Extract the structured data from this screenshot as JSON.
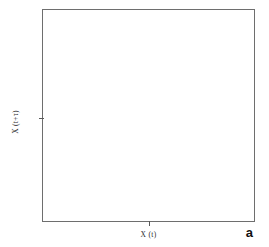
{
  "figure": {
    "panel_label": "a",
    "background_color": "#ffffff",
    "frame_color": "#6e6e6e",
    "axes": {
      "xlabel": "X (t)",
      "ylabel": "X (t+τ)",
      "x_ticks": [
        {
          "label": "",
          "pos": 0.5
        }
      ],
      "y_ticks": [
        {
          "label": "",
          "pos": 0.49
        }
      ]
    }
  },
  "chart_data": {
    "type": "line",
    "subtype": "contour",
    "title": "",
    "subtitle": "",
    "xlabel": "X (t)",
    "ylabel": "X (t+τ)",
    "panel": "a",
    "grid": false,
    "legend": null,
    "tick_labels": {
      "x": [],
      "y": []
    },
    "xlim": [
      0,
      1
    ],
    "ylim": [
      0,
      1
    ],
    "n_levels": 6,
    "level_colors": [
      "#8c8c8c",
      "#7a7a7a",
      "#6a6a6a",
      "#565656",
      "#3d3d3d",
      "#1e1e1e"
    ],
    "level_widths": [
      0.7,
      0.7,
      0.7,
      0.7,
      0.8,
      0.9
    ],
    "levels": [
      0.1,
      0.2,
      0.35,
      0.5,
      0.7,
      0.9
    ],
    "lobes": [
      {
        "name": "upper-right-lobe",
        "center_x": 0.73,
        "center_y": 0.74
      },
      {
        "name": "lower-left-lobe",
        "center_x": 0.3,
        "center_y": 0.31
      }
    ],
    "crossing_point": {
      "x": 0.515,
      "y": 0.52
    },
    "orientation_deg": 45,
    "contours": [
      {
        "level": 0.1,
        "color": "#8c8c8c",
        "width": 0.7,
        "path": "M 0.520 0.545 L 0.556 0.590 L 0.572 0.630 L 0.580 0.676 L 0.588 0.718 L 0.604 0.756 L 0.630 0.790 L 0.664 0.816 L 0.704 0.832 L 0.748 0.838 L 0.790 0.830 L 0.826 0.810 L 0.854 0.780 L 0.870 0.744 L 0.876 0.704 L 0.870 0.664 L 0.852 0.626 L 0.824 0.594 L 0.788 0.568 L 0.746 0.548 L 0.700 0.532 L 0.652 0.518 L 0.604 0.504 L 0.558 0.490 L 0.520 0.476 L 0.482 0.462 L 0.444 0.448 L 0.396 0.434 L 0.348 0.420 L 0.300 0.406 L 0.254 0.388 L 0.212 0.366 L 0.176 0.340 L 0.148 0.308 L 0.130 0.270 L 0.124 0.230 L 0.130 0.190 L 0.146 0.154 L 0.174 0.124 L 0.210 0.104 L 0.252 0.096 L 0.296 0.102 L 0.336 0.118 L 0.370 0.144 L 0.396 0.178 L 0.412 0.216 L 0.420 0.258 L 0.428 0.304 L 0.444 0.344 L 0.480 0.389 L 0.516 0.434 Z"
      },
      {
        "level": 0.2,
        "color": "#7a7a7a",
        "width": 0.7,
        "path": "M 0.520 0.540 L 0.552 0.584 L 0.566 0.624 L 0.574 0.668 L 0.582 0.708 L 0.598 0.744 L 0.622 0.774 L 0.654 0.798 L 0.692 0.812 L 0.734 0.818 L 0.772 0.810 L 0.806 0.790 L 0.830 0.762 L 0.844 0.728 L 0.848 0.690 L 0.842 0.652 L 0.824 0.618 L 0.798 0.588 L 0.764 0.566 L 0.724 0.548 L 0.680 0.534 L 0.634 0.520 L 0.588 0.506 L 0.546 0.492 L 0.512 0.478 L 0.478 0.464 L 0.442 0.450 L 0.398 0.436 L 0.352 0.422 L 0.306 0.408 L 0.264 0.392 L 0.226 0.372 L 0.194 0.346 L 0.170 0.316 L 0.156 0.282 L 0.152 0.246 L 0.158 0.210 L 0.174 0.178 L 0.200 0.152 L 0.234 0.134 L 0.272 0.128 L 0.312 0.134 L 0.348 0.150 L 0.378 0.174 L 0.400 0.206 L 0.414 0.242 L 0.422 0.284 L 0.430 0.326 L 0.446 0.364 L 0.482 0.406 L 0.516 0.444 Z"
      },
      {
        "level": 0.35,
        "color": "#6a6a6a",
        "width": 0.7,
        "path": "M 0.520 0.536 L 0.548 0.578 L 0.560 0.616 L 0.568 0.658 L 0.576 0.696 L 0.592 0.730 L 0.614 0.758 L 0.644 0.778 L 0.678 0.790 L 0.716 0.794 L 0.752 0.786 L 0.782 0.768 L 0.804 0.742 L 0.816 0.710 L 0.818 0.676 L 0.812 0.642 L 0.794 0.610 L 0.770 0.584 L 0.738 0.564 L 0.702 0.548 L 0.662 0.536 L 0.620 0.522 L 0.578 0.510 L 0.540 0.496 L 0.508 0.482 L 0.476 0.468 L 0.442 0.454 L 0.402 0.440 L 0.360 0.426 L 0.318 0.412 L 0.278 0.398 L 0.242 0.380 L 0.212 0.356 L 0.192 0.328 L 0.180 0.298 L 0.178 0.264 L 0.184 0.232 L 0.200 0.204 L 0.224 0.182 L 0.254 0.168 L 0.288 0.164 L 0.324 0.170 L 0.356 0.186 L 0.382 0.208 L 0.400 0.238 L 0.412 0.272 L 0.420 0.310 L 0.428 0.348 L 0.446 0.384 L 0.482 0.420 L 0.516 0.452 Z"
      },
      {
        "level": 0.5,
        "color": "#565656",
        "width": 0.7,
        "path": "M 0.520 0.532 L 0.544 0.572 L 0.554 0.608 L 0.562 0.648 L 0.570 0.684 L 0.584 0.714 L 0.606 0.740 L 0.632 0.758 L 0.664 0.768 L 0.698 0.770 L 0.730 0.762 L 0.758 0.746 L 0.776 0.722 L 0.786 0.692 L 0.788 0.660 L 0.780 0.630 L 0.764 0.602 L 0.740 0.578 L 0.712 0.562 L 0.678 0.548 L 0.642 0.538 L 0.604 0.526 L 0.568 0.514 L 0.534 0.500 L 0.504 0.486 L 0.474 0.472 L 0.442 0.458 L 0.406 0.444 L 0.368 0.430 L 0.330 0.418 L 0.294 0.404 L 0.262 0.388 L 0.236 0.368 L 0.216 0.344 L 0.206 0.316 L 0.204 0.286 L 0.210 0.258 L 0.226 0.234 L 0.248 0.216 L 0.274 0.204 L 0.304 0.202 L 0.336 0.208 L 0.364 0.222 L 0.386 0.242 L 0.402 0.270 L 0.412 0.302 L 0.420 0.336 L 0.428 0.370 L 0.448 0.402 L 0.484 0.434 L 0.516 0.460 Z"
      },
      {
        "level": 0.7,
        "color": "#3d3d3d",
        "width": 0.8,
        "path": "M 0.520 0.528 L 0.540 0.566 L 0.548 0.600 L 0.556 0.638 L 0.564 0.672 L 0.578 0.700 L 0.596 0.722 L 0.620 0.738 L 0.648 0.746 L 0.678 0.748 L 0.706 0.740 L 0.730 0.724 L 0.746 0.702 L 0.754 0.676 L 0.756 0.646 L 0.748 0.618 L 0.732 0.594 L 0.710 0.572 L 0.684 0.558 L 0.654 0.546 L 0.622 0.538 L 0.588 0.528 L 0.556 0.518 L 0.528 0.504 L 0.500 0.490 L 0.472 0.476 L 0.442 0.462 L 0.410 0.450 L 0.376 0.436 L 0.342 0.424 L 0.310 0.412 L 0.282 0.396 L 0.258 0.380 L 0.242 0.358 L 0.232 0.334 L 0.230 0.308 L 0.238 0.282 L 0.252 0.262 L 0.272 0.248 L 0.296 0.240 L 0.322 0.240 L 0.348 0.248 L 0.372 0.262 L 0.390 0.282 L 0.404 0.308 L 0.412 0.336 L 0.420 0.366 L 0.430 0.396 L 0.450 0.424 L 0.486 0.450 L 0.516 0.470 Z"
      },
      {
        "level": 0.9,
        "color": "#1e1e1e",
        "width": 0.9,
        "path": "M 0.520 0.524 L 0.536 0.558 L 0.544 0.592 L 0.550 0.626 L 0.558 0.658 L 0.570 0.684 L 0.588 0.704 L 0.608 0.718 L 0.632 0.724 L 0.658 0.726 L 0.682 0.718 L 0.702 0.704 L 0.716 0.684 L 0.722 0.660 L 0.722 0.634 L 0.714 0.610 L 0.700 0.588 L 0.680 0.570 L 0.656 0.556 L 0.630 0.546 L 0.602 0.538 L 0.572 0.530 L 0.546 0.520 L 0.522 0.508 L 0.498 0.494 L 0.472 0.480 L 0.444 0.468 L 0.414 0.456 L 0.384 0.444 L 0.354 0.432 L 0.326 0.420 L 0.300 0.406 L 0.280 0.390 L 0.266 0.372 L 0.258 0.352 L 0.258 0.330 L 0.266 0.310 L 0.280 0.294 L 0.300 0.284 L 0.322 0.280 L 0.344 0.284 L 0.366 0.296 L 0.384 0.314 L 0.398 0.336 L 0.408 0.362 L 0.416 0.390 L 0.426 0.416 L 0.444 0.442 L 0.480 0.466 L 0.514 0.484 Z"
      }
    ]
  }
}
